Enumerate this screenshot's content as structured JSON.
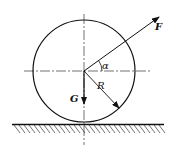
{
  "diagram": {
    "labels": {
      "force": "F",
      "gravity": "G",
      "radius": "R",
      "angle": "α"
    },
    "colors": {
      "stroke": "#111111",
      "background": "#ffffff"
    }
  }
}
